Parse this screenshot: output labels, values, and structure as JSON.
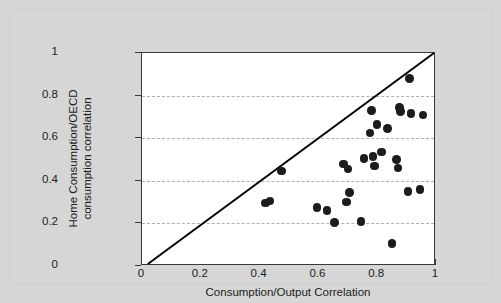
{
  "figure": {
    "background_color": "#d6d6d6",
    "plot_background_color": "#ffffff",
    "axis_color": "#3a3a3a",
    "grid_color": "#9aa4b0",
    "marker_color": "#1c1c1c",
    "line_color": "#000000"
  },
  "chart_data": {
    "type": "scatter",
    "title": "",
    "xlabel": "Consumption/Output Correlation",
    "ylabel_line1": "Home Consumption/OECD",
    "ylabel_line2": "consumption correlation",
    "xlim": [
      0,
      1
    ],
    "ylim": [
      0,
      1
    ],
    "xticks": [
      "0",
      "0.2",
      "0.4",
      "0.6",
      "0.8",
      "1"
    ],
    "xtick_values": [
      0,
      0.2,
      0.4,
      0.6,
      0.8,
      1
    ],
    "yticks": [
      "0",
      "0.2",
      "0.4",
      "0.6",
      "0.8",
      "1"
    ],
    "ytick_values": [
      0,
      0.2,
      0.4,
      0.6,
      0.8,
      1
    ],
    "grid": "horizontal-dashed",
    "gridline_values": [
      0.2,
      0.4,
      0.6,
      0.8
    ],
    "legend": "none",
    "reference_line": {
      "label": "45-degree line",
      "from": [
        0.02,
        0.0
      ],
      "to": [
        1.0,
        1.0
      ]
    },
    "points": [
      {
        "x": 0.42,
        "y": 0.295
      },
      {
        "x": 0.435,
        "y": 0.305
      },
      {
        "x": 0.475,
        "y": 0.445
      },
      {
        "x": 0.595,
        "y": 0.275
      },
      {
        "x": 0.63,
        "y": 0.26
      },
      {
        "x": 0.655,
        "y": 0.205
      },
      {
        "x": 0.685,
        "y": 0.48
      },
      {
        "x": 0.695,
        "y": 0.3
      },
      {
        "x": 0.7,
        "y": 0.455
      },
      {
        "x": 0.705,
        "y": 0.345
      },
      {
        "x": 0.745,
        "y": 0.21
      },
      {
        "x": 0.755,
        "y": 0.505
      },
      {
        "x": 0.775,
        "y": 0.625
      },
      {
        "x": 0.78,
        "y": 0.73
      },
      {
        "x": 0.785,
        "y": 0.515
      },
      {
        "x": 0.79,
        "y": 0.47
      },
      {
        "x": 0.8,
        "y": 0.665
      },
      {
        "x": 0.815,
        "y": 0.535
      },
      {
        "x": 0.835,
        "y": 0.645
      },
      {
        "x": 0.85,
        "y": 0.105
      },
      {
        "x": 0.865,
        "y": 0.5
      },
      {
        "x": 0.87,
        "y": 0.46
      },
      {
        "x": 0.875,
        "y": 0.745
      },
      {
        "x": 0.88,
        "y": 0.725
      },
      {
        "x": 0.905,
        "y": 0.35
      },
      {
        "x": 0.91,
        "y": 0.88
      },
      {
        "x": 0.915,
        "y": 0.715
      },
      {
        "x": 0.945,
        "y": 0.36
      },
      {
        "x": 0.955,
        "y": 0.71
      }
    ]
  }
}
